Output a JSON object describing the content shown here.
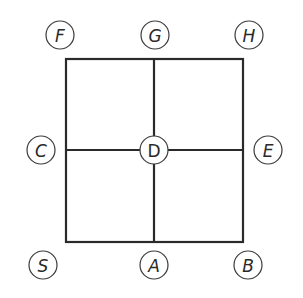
{
  "diagram": {
    "type": "grid-graph",
    "colors": {
      "line": "#2a2a2a",
      "node_stroke": "#3a3a3a",
      "background": "#ffffff"
    },
    "grid": {
      "x1": 66,
      "y1": 59,
      "x2": 243,
      "y2": 242,
      "cx": 154,
      "cy": 150
    },
    "nodes": [
      {
        "id": "F",
        "label": "F",
        "x": 60,
        "y": 35,
        "italic": true
      },
      {
        "id": "G",
        "label": "G",
        "x": 155,
        "y": 35,
        "italic": true
      },
      {
        "id": "H",
        "label": "H",
        "x": 249,
        "y": 35,
        "italic": true
      },
      {
        "id": "C",
        "label": "C",
        "x": 41,
        "y": 150,
        "italic": true
      },
      {
        "id": "D",
        "label": "D",
        "x": 154,
        "y": 150,
        "italic": false
      },
      {
        "id": "E",
        "label": "E",
        "x": 268,
        "y": 150,
        "italic": true
      },
      {
        "id": "S",
        "label": "S",
        "x": 43,
        "y": 265,
        "italic": true
      },
      {
        "id": "A",
        "label": "A",
        "x": 154,
        "y": 265,
        "italic": true
      },
      {
        "id": "B",
        "label": "B",
        "x": 248,
        "y": 265,
        "italic": true
      }
    ]
  }
}
